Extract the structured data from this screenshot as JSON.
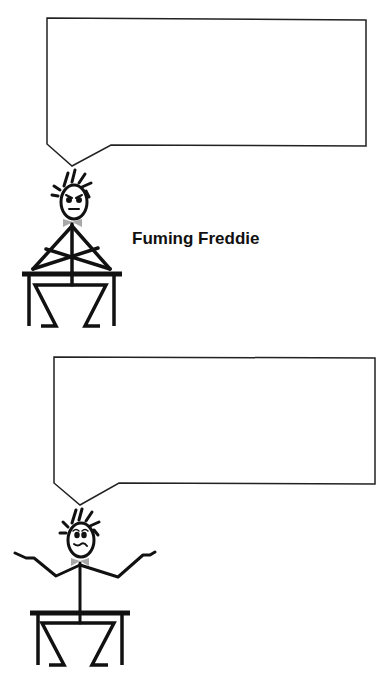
{
  "panels": [
    {
      "id": "fuming",
      "caption": "Fuming Freddie",
      "speech_bubble_text": "",
      "expression": "angry",
      "pose": "arms-crossed-on-desk"
    },
    {
      "id": "cool",
      "caption": "Cool Freddie",
      "speech_bubble_text": "",
      "expression": "calm",
      "pose": "arms-outstretched-shrug"
    }
  ],
  "colors": {
    "stroke": "#111111",
    "bowtie": "#a8a8a8",
    "background": "#ffffff"
  }
}
